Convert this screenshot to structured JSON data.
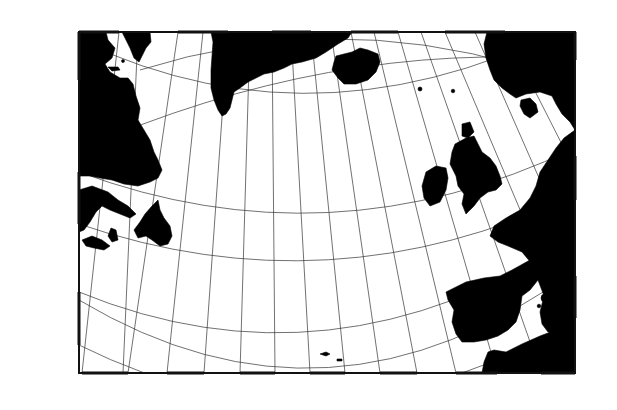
{
  "panel_label": "a",
  "map": {
    "type": "conic-projection-map",
    "region": "North Atlantic",
    "frame": {
      "left": 79,
      "top": 32,
      "right": 575,
      "bottom": 373
    },
    "top_axis_labels": [
      {
        "text": "70°",
        "x": 119
      },
      {
        "text": "60°",
        "x": 178
      },
      {
        "text": "50°",
        "x": 228
      },
      {
        "text": "40°",
        "x": 272
      },
      {
        "text": "30°",
        "x": 311
      },
      {
        "text": "20°",
        "x": 351
      },
      {
        "text": "10°",
        "x": 398
      },
      {
        "text": "0°",
        "x": 445
      },
      {
        "text": "10°",
        "x": 505
      }
    ],
    "bottom_axis_labels": [
      {
        "text": "60°",
        "x": 82
      },
      {
        "text": "50°",
        "x": 167
      },
      {
        "text": "40°",
        "x": 240
      },
      {
        "text": "30°",
        "x": 310
      },
      {
        "text": "20°",
        "x": 380
      },
      {
        "text": "10°",
        "x": 456
      },
      {
        "text": "0°",
        "x": 541
      }
    ],
    "left_axis_labels": [
      {
        "text": "60°",
        "y": 33
      },
      {
        "text": "50°",
        "y": 172
      },
      {
        "text": "40°",
        "y": 292
      }
    ],
    "right_axis_labels": [
      {
        "text": "50°",
        "y": 156
      },
      {
        "text": "40°",
        "y": 276
      }
    ],
    "sites": [
      {
        "name": "V 23-42",
        "x": 318,
        "y": 109,
        "label_x": 300,
        "label_y": 124
      },
      {
        "name": "V27-20",
        "x": 222,
        "y": 190,
        "label_x": 203,
        "label_y": 205
      },
      {
        "name": "V27-116",
        "x": 305,
        "y": 219,
        "label_x": 268,
        "label_y": 234
      },
      {
        "name": "K708-7",
        "x": 339,
        "y": 203,
        "label_x": 339,
        "label_y": 218
      },
      {
        "name": "K708-1",
        "x": 344,
        "y": 243,
        "label_x": 339,
        "label_y": 259
      },
      {
        "name": "V29-179",
        "x": 343,
        "y": 302,
        "label_x": 341,
        "label_y": 317
      },
      {
        "name": "V30-97",
        "x": 290,
        "y": 328,
        "label_x": 274,
        "label_y": 324
      }
    ]
  }
}
